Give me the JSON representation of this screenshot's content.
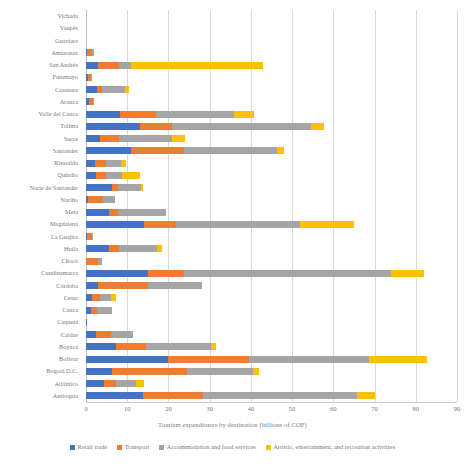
{
  "chart_data": {
    "type": "bar",
    "orientation": "horizontal",
    "stacked": true,
    "title": "",
    "xlabel": "Tourism expenditures by destination  (billions of COP)",
    "ylabel": "",
    "xlim": [
      0,
      90
    ],
    "xticks": [
      0,
      10,
      20,
      30,
      40,
      50,
      60,
      70,
      80,
      90
    ],
    "xtick_labels": [
      "0",
      "10",
      "20",
      "30",
      "40",
      "50",
      "60",
      "70",
      "80",
      "90"
    ],
    "grid": true,
    "legend_position": "bottom",
    "colors": {
      "retail_trade": "#4472C4",
      "transport": "#ED7D31",
      "accommodation_food": "#A5A5A5",
      "artistic_recreation": "#FFC000"
    },
    "categories": [
      "Vichada",
      "Vaupés",
      "Guaviare",
      "Amazonas",
      "San Andrés",
      "Putumayo",
      "Casanare",
      "Arauca",
      "Valle del Cauca",
      "Tolima",
      "Sucre",
      "Santander",
      "Risaralda",
      "Quindío",
      "Norte de Santander",
      "Nariño",
      "Meta",
      "Magdalena",
      "La Guajira",
      "Huila",
      "Chocó",
      "Cundinamarca",
      "Córdoba",
      "Cesar",
      "Cauca",
      "Caquetá",
      "Caldas",
      "Boyacá",
      "Bolívar",
      "Bogotá D.C.",
      "Atlántico",
      "Antioquia"
    ],
    "series": [
      {
        "name": "Retail trade",
        "color": "#4472C4",
        "values": [
          0,
          0,
          0,
          0.3,
          2.8,
          0.4,
          2.6,
          0.7,
          8.3,
          13.0,
          3.5,
          11.0,
          2.3,
          2.4,
          6.4,
          0.6,
          5.6,
          14.1,
          0.3,
          5.7,
          0.0,
          15.1,
          3.0,
          1.5,
          1.3,
          0.2,
          2.4,
          7.3,
          19.8,
          6.3,
          4.4,
          13.9
        ]
      },
      {
        "name": "Transport",
        "color": "#ED7D31",
        "values": [
          0,
          0,
          0,
          1.2,
          5.2,
          0.9,
          1.4,
          0.9,
          8.7,
          7.8,
          4.4,
          12.8,
          2.6,
          2.4,
          1.4,
          3.5,
          2.2,
          7.7,
          1.1,
          2.2,
          2.8,
          8.6,
          12.0,
          1.9,
          1.4,
          0.0,
          3.6,
          7.2,
          19.8,
          18.2,
          3.0,
          14.6
        ]
      },
      {
        "name": "Accommodation and food services",
        "color": "#A5A5A5",
        "values": [
          0,
          0,
          0,
          0.4,
          3.0,
          0.1,
          5.4,
          0.1,
          18.8,
          33.8,
          13.0,
          22.5,
          3.7,
          4.0,
          5.5,
          3.0,
          11.6,
          30.2,
          0.1,
          9.3,
          1.0,
          50.2,
          13.2,
          2.7,
          3.5,
          0.0,
          5.3,
          15.8,
          29.1,
          16.0,
          4.7,
          37.3
        ]
      },
      {
        "name": "Artistic, entertainment, and recreation activities",
        "color": "#FFC000",
        "values": [
          0,
          0,
          0,
          0.0,
          32.0,
          0.0,
          1.0,
          0.0,
          5.0,
          3.2,
          3.1,
          1.7,
          1.0,
          4.2,
          0.5,
          0.0,
          0.0,
          13.0,
          0.0,
          1.2,
          0.0,
          8.1,
          0.0,
          1.3,
          0.0,
          0.0,
          0.0,
          1.2,
          14.0,
          1.5,
          2.0,
          4.2
        ]
      }
    ]
  },
  "legend": {
    "items": [
      {
        "label": "Retail trade",
        "color": "#4472C4"
      },
      {
        "label": "Transport",
        "color": "#ED7D31"
      },
      {
        "label": "Accommodation and food services",
        "color": "#A5A5A5"
      },
      {
        "label": "Artistic, entertainment, and recreation activities",
        "color": "#FFC000"
      }
    ]
  }
}
